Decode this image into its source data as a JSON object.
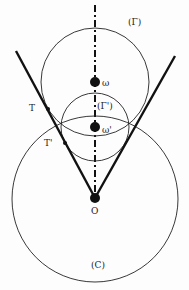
{
  "diagram": {
    "type": "geometry",
    "labels": {
      "gamma": "(Γ)",
      "gamma_prime": "(Γ')",
      "omega": "ω",
      "omega_prime": "ω'",
      "T": "T",
      "T_prime": "T'",
      "O": "O",
      "C": "(C)"
    },
    "circles": [
      {
        "name": "Γ",
        "cx": 95,
        "cy": 82,
        "r": 54
      },
      {
        "name": "Γ'",
        "cx": 95,
        "cy": 127,
        "r": 34
      },
      {
        "name": "C",
        "cx": 95,
        "cy": 199,
        "r": 83
      }
    ],
    "points": [
      {
        "name": "ω",
        "x": 95,
        "y": 82
      },
      {
        "name": "ω'",
        "x": 95,
        "y": 127
      },
      {
        "name": "T",
        "x": 48,
        "y": 109
      },
      {
        "name": "T'",
        "x": 65,
        "y": 143
      },
      {
        "name": "O",
        "x": 95,
        "y": 198
      }
    ],
    "stroke_color": "#111111"
  }
}
